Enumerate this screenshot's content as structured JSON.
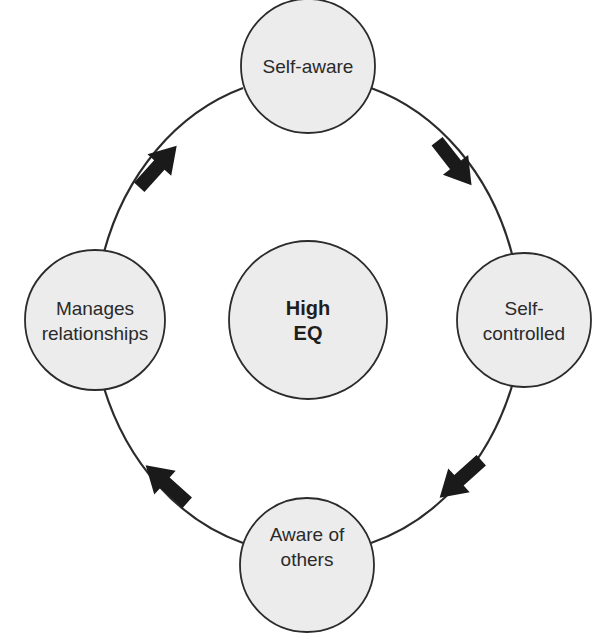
{
  "diagram": {
    "type": "cycle",
    "colors": {
      "background": "#ffffff",
      "node_fill": "#ececec",
      "stroke": "#2b2b2b",
      "arrow": "#1a1a1a",
      "text": "#2a2a2a"
    },
    "center": {
      "line1": "High",
      "line2": "EQ"
    },
    "nodes": [
      {
        "id": "top",
        "line1": "Self-aware",
        "line2": ""
      },
      {
        "id": "right",
        "line1": "Self-",
        "line2": "controlled"
      },
      {
        "id": "bottom",
        "line1": "Aware of",
        "line2": "others"
      },
      {
        "id": "left",
        "line1": "Manages",
        "line2": "relationships"
      }
    ],
    "arrows": [
      {
        "from": "Self-aware",
        "to": "Self-controlled",
        "icon": "arrow-icon"
      },
      {
        "from": "Self-controlled",
        "to": "Aware of others",
        "icon": "arrow-icon"
      },
      {
        "from": "Aware of others",
        "to": "Manages relationships",
        "icon": "arrow-icon"
      },
      {
        "from": "Manages relationships",
        "to": "Self-aware",
        "icon": "arrow-icon"
      }
    ]
  }
}
